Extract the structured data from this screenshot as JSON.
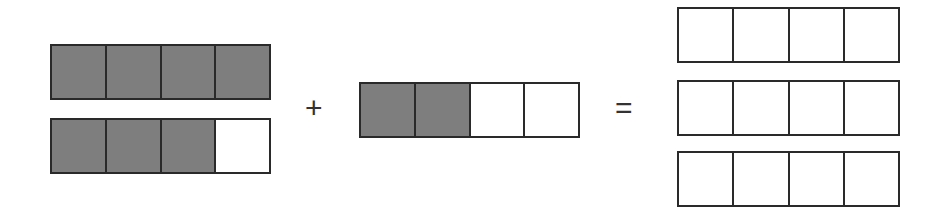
{
  "diagram": {
    "parts_per_bar": 4,
    "colors": {
      "shaded": "#8c8c8c",
      "unshaded": "#ffffff",
      "outline": "#2a2a2a"
    },
    "left_operand": {
      "bars": [
        {
          "shaded": [
            true,
            true,
            true,
            true
          ]
        },
        {
          "shaded": [
            true,
            true,
            true,
            false
          ]
        }
      ]
    },
    "operator_plus": "+",
    "right_operand": {
      "bars": [
        {
          "shaded": [
            true,
            true,
            false,
            false
          ]
        }
      ]
    },
    "operator_equals": "=",
    "result": {
      "bars": [
        {
          "shaded": [
            false,
            false,
            false,
            false
          ]
        },
        {
          "shaded": [
            false,
            false,
            false,
            false
          ]
        },
        {
          "shaded": [
            false,
            false,
            false,
            false
          ]
        }
      ]
    }
  }
}
